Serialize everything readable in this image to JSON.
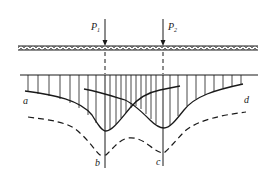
{
  "diagram": {
    "loads": [
      {
        "label": "P",
        "subscript": "1"
      },
      {
        "label": "P",
        "subscript": "2"
      }
    ],
    "curve_labels": {
      "a": "a",
      "b": "b",
      "c": "c",
      "d": "d"
    },
    "colors": {
      "stroke": "#1a1a1a",
      "background": "#ffffff"
    }
  }
}
